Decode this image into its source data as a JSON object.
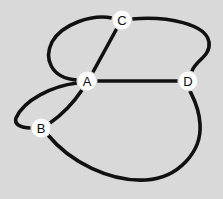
{
  "figure": {
    "kind": "undirected-graph-drawing",
    "width": 223,
    "height": 199,
    "background_color": "#d9d9d9",
    "edge_color": "#111111",
    "node_fill_color": "#fbfbfb",
    "node_label_color": "#101010",
    "edge_stroke_width": 3.6,
    "node_radius": 10
  },
  "nodes": [
    {
      "id": "A",
      "label": "A",
      "x": 87,
      "y": 81
    },
    {
      "id": "B",
      "label": "B",
      "x": 41,
      "y": 128
    },
    {
      "id": "C",
      "label": "C",
      "x": 122,
      "y": 20
    },
    {
      "id": "D",
      "label": "D",
      "x": 188,
      "y": 81
    }
  ],
  "edges": [
    {
      "id": "A-C-direct",
      "source": "A",
      "target": "C",
      "style": "straight",
      "path": "M 93 72 L 116 30"
    },
    {
      "id": "A-C-loop-left",
      "source": "A",
      "target": "C",
      "style": "curved-left",
      "path": "M 77 80 C 50 78 44 58 52 42 C 62 24 92 14 112 18"
    },
    {
      "id": "A-B-direct",
      "source": "A",
      "target": "B",
      "style": "curved",
      "path": "M 82 90 C 72 105 60 116 50 123"
    },
    {
      "id": "A-B-loop-left",
      "source": "A",
      "target": "B",
      "style": "curved-left",
      "path": "M 77 83 C 52 86 24 100 16 118 C 14 124 20 128 31 128"
    },
    {
      "id": "A-D",
      "source": "A",
      "target": "D",
      "style": "straight",
      "path": "M 97 81 L 178 81"
    },
    {
      "id": "C-D",
      "source": "C",
      "target": "D",
      "style": "curved-right",
      "path": "M 132 19 C 168 16 206 24 209 42 C 211 56 196 60 192 71"
    },
    {
      "id": "B-D",
      "source": "B",
      "target": "D",
      "style": "curved-bottom",
      "path": "M 48 135 C 70 162 110 182 146 180 C 178 178 202 152 200 124 C 199 106 192 96 190 91"
    }
  ]
}
